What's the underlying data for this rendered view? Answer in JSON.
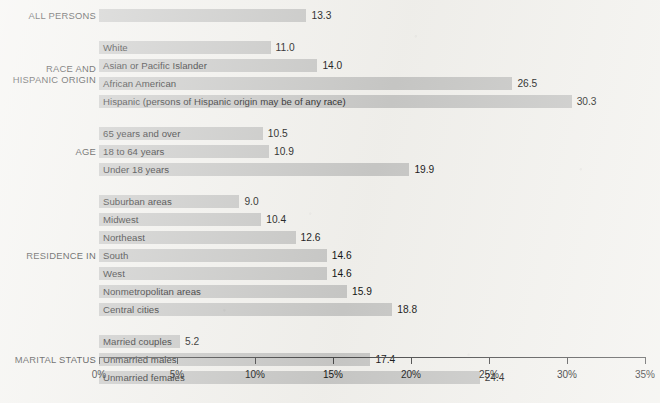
{
  "chart_data": {
    "type": "bar",
    "orientation": "horizontal",
    "title": "",
    "xlabel": "",
    "ylabel": "",
    "xlim": [
      0,
      35
    ],
    "grid": false,
    "legend": null,
    "value_suffix": "",
    "axis": {
      "ticks": [
        0,
        5,
        10,
        15,
        20,
        25,
        30,
        35
      ],
      "tick_labels": [
        "0%",
        "5%",
        "10%",
        "15%",
        "20%",
        "25%",
        "30%",
        "35%"
      ]
    },
    "groups": [
      {
        "label": "ALL PERSONS",
        "label_lines": [
          "ALL PERSONS"
        ],
        "rows": [
          {
            "category": "",
            "value": 13.3,
            "value_label": "13.3"
          }
        ]
      },
      {
        "label": "RACE AND HISPANIC ORIGIN",
        "label_lines": [
          "RACE AND",
          "HISPANIC ORIGIN"
        ],
        "rows": [
          {
            "category": "White",
            "value": 11.0,
            "value_label": "11.0"
          },
          {
            "category": "Asian or Pacific Islander",
            "value": 14.0,
            "value_label": "14.0"
          },
          {
            "category": "African American",
            "value": 26.5,
            "value_label": "26.5"
          },
          {
            "category": "Hispanic (persons of Hispanic origin may be of any race)",
            "value": 30.3,
            "value_label": "30.3"
          }
        ]
      },
      {
        "label": "AGE",
        "label_lines": [
          "AGE"
        ],
        "rows": [
          {
            "category": "65 years and over",
            "value": 10.5,
            "value_label": "10.5"
          },
          {
            "category": "18 to 64 years",
            "value": 10.9,
            "value_label": "10.9"
          },
          {
            "category": "Under 18 years",
            "value": 19.9,
            "value_label": "19.9"
          }
        ]
      },
      {
        "label": "RESIDENCE IN",
        "label_lines": [
          "RESIDENCE IN"
        ],
        "rows": [
          {
            "category": "Suburban areas",
            "value": 9.0,
            "value_label": "9.0"
          },
          {
            "category": "Midwest",
            "value": 10.4,
            "value_label": "10.4"
          },
          {
            "category": "Northeast",
            "value": 12.6,
            "value_label": "12.6"
          },
          {
            "category": "South",
            "value": 14.6,
            "value_label": "14.6"
          },
          {
            "category": "West",
            "value": 14.6,
            "value_label": "14.6"
          },
          {
            "category": "Nonmetropolitan areas",
            "value": 15.9,
            "value_label": "15.9"
          },
          {
            "category": "Central cities",
            "value": 18.8,
            "value_label": "18.8"
          }
        ]
      },
      {
        "label": "MARITAL STATUS",
        "label_lines": [
          "MARITAL STATUS"
        ],
        "rows": [
          {
            "category": "Married couples",
            "value": 5.2,
            "value_label": "5.2"
          },
          {
            "category": "Unmarried males",
            "value": 17.4,
            "value_label": "17.4"
          },
          {
            "category": "Unmarried females",
            "value": 24.4,
            "value_label": "24.4"
          }
        ]
      }
    ],
    "colors": {
      "bar": "#c8c8c6",
      "background": "#f2f1ed",
      "axis": "#4a4a4a",
      "text": "#1b1b1b"
    }
  }
}
